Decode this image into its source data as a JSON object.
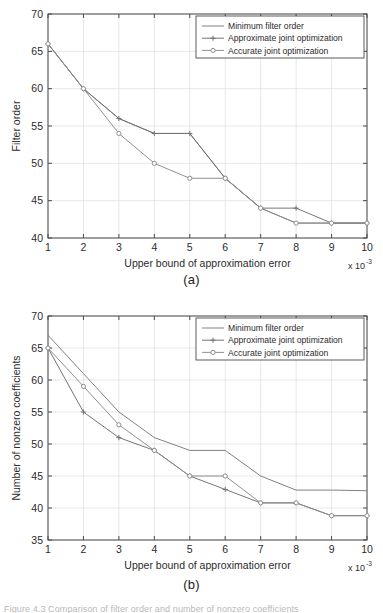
{
  "figure": {
    "caption_fragment": "Figure 4.3  Comparison of filter order and number of nonzero coefficients"
  },
  "panels": [
    {
      "id": "a",
      "sublabel": "(a)",
      "legend_entries": [
        {
          "label": "Minimum filter order",
          "marker": "none",
          "color": "#7a7a7a"
        },
        {
          "label": "Approximate joint optimization",
          "marker": "plus",
          "color": "#6f6f6f"
        },
        {
          "label": "Accurate joint optimization",
          "marker": "circle",
          "color": "#8a8a8a"
        }
      ]
    },
    {
      "id": "b",
      "sublabel": "(b)",
      "legend_entries": [
        {
          "label": "Minimum filter order",
          "marker": "none",
          "color": "#7a7a7a"
        },
        {
          "label": "Approximate joint optimization",
          "marker": "plus",
          "color": "#6f6f6f"
        },
        {
          "label": "Accurate joint optimization",
          "marker": "circle",
          "color": "#8a8a8a"
        }
      ]
    }
  ],
  "chart_data": [
    {
      "type": "line",
      "panel": "a",
      "title": "",
      "xlabel": "Upper bound of approximation error",
      "ylabel": "Filter order",
      "x_multiplier": "x 10",
      "x_multiplier_exponent": "-3",
      "x": [
        1,
        2,
        3,
        4,
        5,
        6,
        7,
        8,
        9,
        10
      ],
      "xticklabels": [
        "1",
        "2",
        "3",
        "4",
        "5",
        "6",
        "7",
        "8",
        "9",
        "10"
      ],
      "yticklabels": [
        "40",
        "45",
        "50",
        "55",
        "60",
        "65",
        "70"
      ],
      "xlim": [
        1,
        10
      ],
      "ylim": [
        40,
        70
      ],
      "ytick_step": 5,
      "grid": true,
      "legend_position": "top-right",
      "series": [
        {
          "name": "Minimum filter order",
          "marker": "none",
          "values": [
            66,
            60,
            56,
            54,
            54,
            48,
            44,
            42,
            42,
            42
          ]
        },
        {
          "name": "Approximate joint optimization",
          "marker": "plus",
          "values": [
            66,
            60,
            56,
            54,
            54,
            48,
            44,
            44,
            42,
            42
          ]
        },
        {
          "name": "Accurate joint optimization",
          "marker": "circle",
          "values": [
            66,
            60,
            54,
            50,
            48,
            48,
            44,
            42,
            42,
            42
          ]
        }
      ]
    },
    {
      "type": "line",
      "panel": "b",
      "title": "",
      "xlabel": "Upper bound of approximation error",
      "ylabel": "Number of nonzero coefficients",
      "x_multiplier": "x 10",
      "x_multiplier_exponent": "-3",
      "x": [
        1,
        2,
        3,
        4,
        5,
        6,
        7,
        8,
        9,
        10
      ],
      "xticklabels": [
        "1",
        "2",
        "3",
        "4",
        "5",
        "6",
        "7",
        "8",
        "9",
        "10"
      ],
      "yticklabels": [
        "35",
        "40",
        "45",
        "50",
        "55",
        "60",
        "65",
        "70"
      ],
      "xlim": [
        1,
        10
      ],
      "ylim": [
        35,
        70
      ],
      "ytick_step": 5,
      "grid": true,
      "legend_position": "top-right",
      "series": [
        {
          "name": "Minimum filter order",
          "marker": "none",
          "values": [
            67,
            61,
            55,
            51,
            49,
            49,
            45,
            42.8,
            42.8,
            42.7
          ]
        },
        {
          "name": "Approximate joint optimization",
          "marker": "plus",
          "values": [
            65,
            55,
            51,
            49,
            45,
            42.9,
            40.8,
            40.8,
            38.8,
            38.8
          ]
        },
        {
          "name": "Accurate joint optimization",
          "marker": "circle",
          "values": [
            65,
            59,
            53,
            49,
            45,
            45,
            40.8,
            40.8,
            38.8,
            38.8
          ]
        }
      ]
    }
  ]
}
